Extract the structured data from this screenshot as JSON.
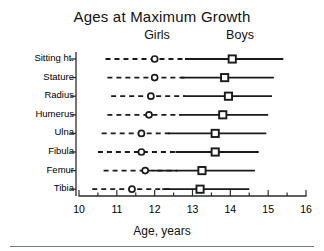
{
  "chart_data": {
    "type": "scatter",
    "title": "Ages at Maximum Growth",
    "xlabel": "Age, years",
    "ylabel": "",
    "xlim": [
      10,
      16
    ],
    "xticks": [
      10,
      11,
      12,
      13,
      14,
      15,
      16
    ],
    "xtick_labels": [
      "10",
      "11",
      "12",
      "13",
      "14",
      "15",
      "16"
    ],
    "minor_tick_step": 0.5,
    "grid": false,
    "legend": [
      "Girls",
      "Boys"
    ],
    "legend_position": "top-inside",
    "categories": [
      "Sitting ht.",
      "Stature",
      "Radius",
      "Humerus",
      "Ulna",
      "Fibula",
      "Femur",
      "Tibia"
    ],
    "series": [
      {
        "name": "Girls",
        "style": "dashed",
        "marker": "circle",
        "values": [
          12.0,
          12.0,
          11.9,
          11.85,
          11.65,
          11.65,
          11.75,
          11.4
        ],
        "low": [
          10.7,
          10.75,
          10.85,
          10.75,
          10.6,
          10.5,
          10.65,
          10.35
        ],
        "high": [
          12.9,
          12.8,
          12.8,
          12.7,
          12.45,
          12.65,
          12.6,
          12.45
        ]
      },
      {
        "name": "Boys",
        "style": "solid",
        "marker": "square",
        "values": [
          14.05,
          13.85,
          13.95,
          13.8,
          13.6,
          13.6,
          13.25,
          13.2
        ],
        "low": [
          12.8,
          12.7,
          12.75,
          12.65,
          12.35,
          12.55,
          11.95,
          12.2
        ],
        "high": [
          15.4,
          15.15,
          15.1,
          15.0,
          14.95,
          14.75,
          14.65,
          14.5
        ]
      }
    ]
  },
  "axis": {
    "x_title": "Age, years"
  }
}
